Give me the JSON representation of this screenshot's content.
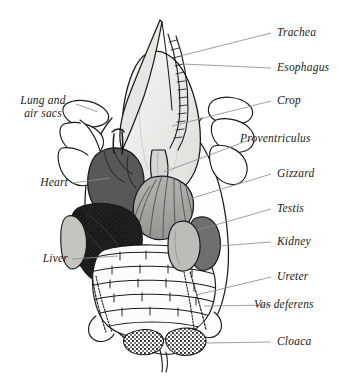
{
  "figure": {
    "background_color": "#ffffff",
    "ink_color": "#1b1b1b",
    "leader_color": "#8d8d8d"
  },
  "labels": {
    "trachea": "Trachea",
    "esophagus": "Esophagus",
    "crop": "Crop",
    "proventriculus": "Proventriculus",
    "gizzard": "Gizzard",
    "testis": "Testis",
    "kidney": "Kidney",
    "ureter": "Ureter",
    "vas_deferens": "Vas deferens",
    "cloaca": "Cloaca",
    "lung_and_air_sacs_line1": "Lung and",
    "lung_and_air_sacs_line2": "air sacs",
    "heart": "Heart",
    "liver": "Liver"
  },
  "organs": [
    {
      "name": "trachea",
      "label": "Trachea",
      "tone": "#e9e9e7",
      "side": "center"
    },
    {
      "name": "esophagus",
      "label": "Esophagus",
      "tone": "#f2f2f0",
      "side": "center"
    },
    {
      "name": "crop",
      "label": "Crop",
      "tone": "#eeeeec",
      "side": "center"
    },
    {
      "name": "proventriculus",
      "label": "Proventriculus",
      "tone": "#d9d9d6",
      "side": "center"
    },
    {
      "name": "gizzard",
      "label": "Gizzard",
      "tone": "#a6a6a3",
      "side": "center"
    },
    {
      "name": "heart",
      "label": "Heart",
      "tone": "#565656",
      "side": "left"
    },
    {
      "name": "liver",
      "label": "Liver",
      "tone": "#1f1f1f",
      "side": "left"
    },
    {
      "name": "lung-air-sacs",
      "label": "Lung and air sacs",
      "tone": "#ffffff",
      "side": "both"
    },
    {
      "name": "testis",
      "label": "Testis",
      "tone": "#b9b9b5",
      "side": "right"
    },
    {
      "name": "kidney",
      "label": "Kidney",
      "tone": "#6f6f6d",
      "side": "right"
    },
    {
      "name": "ureter",
      "label": "Ureter",
      "tone": "#2a2a2a",
      "side": "right"
    },
    {
      "name": "vas-deferens",
      "label": "Vas deferens",
      "tone": "#2a2a2a",
      "side": "both"
    },
    {
      "name": "cloaca",
      "label": "Cloaca",
      "tone": "#2a2a2a",
      "side": "center"
    },
    {
      "name": "intestine",
      "label": "",
      "tone": "#fbfbfa",
      "side": "center"
    }
  ]
}
